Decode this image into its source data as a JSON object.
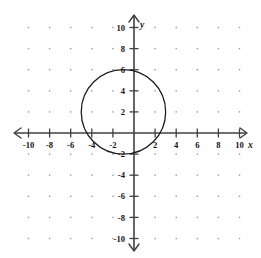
{
  "chart_data": {
    "type": "scatter",
    "title": "",
    "subtitle": "",
    "xlabel": "x",
    "ylabel": "y",
    "xlim": [
      -10,
      10
    ],
    "ylim": [
      -10,
      10
    ],
    "grid": true,
    "grid_style": "dotted",
    "grid_step": 2,
    "legend": "none",
    "x_ticks": [
      -10,
      -8,
      -6,
      -4,
      -2,
      2,
      4,
      6,
      8,
      10
    ],
    "y_ticks": [
      10,
      8,
      6,
      4,
      2,
      -2,
      -4,
      -6,
      -8,
      -10
    ],
    "x_tick_labels": [
      "-10",
      "-8",
      "-6",
      "-4",
      "-2",
      "2",
      "4",
      "6",
      "8",
      "10"
    ],
    "y_tick_labels": [
      "10",
      "8",
      "6",
      "4",
      "2",
      "-2",
      "-4",
      "-6",
      "-8",
      "-10"
    ],
    "axis_color": "#404040",
    "curve_color": "#1d1d1d",
    "grid_dot_color": "#9a9a9a",
    "series": [
      {
        "name": "circle",
        "type": "circle",
        "center": [
          -1,
          2
        ],
        "radius": 4,
        "equation": "(x + 1)^2 + (y - 2)^2 = 16",
        "x_intercepts": [
          -4.46,
          2.46
        ],
        "y_intercepts": [
          6,
          -2
        ],
        "top_point": [
          -1,
          6
        ],
        "bottom_point": [
          -1,
          -2
        ],
        "left_point": [
          -5,
          2
        ],
        "right_point": [
          3,
          2
        ]
      }
    ]
  },
  "labels": {
    "x_axis_name": "x",
    "y_axis_name": "y"
  }
}
